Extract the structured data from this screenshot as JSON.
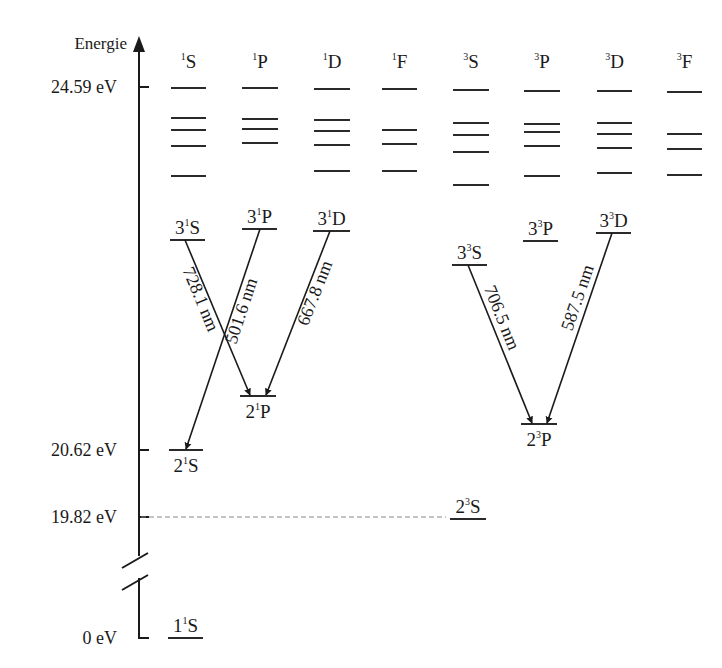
{
  "axis": {
    "label": "Energie",
    "x": 139,
    "top_y": 36,
    "break_top_y": 556,
    "break_bottom_y": 578,
    "bottom_y": 638,
    "ticks": [
      {
        "label": "24.59 eV",
        "y": 87
      },
      {
        "label": "20.62 eV",
        "y": 450
      },
      {
        "label": "19.82 eV",
        "y": 517
      },
      {
        "label": "0 eV",
        "y": 638
      }
    ]
  },
  "columns": [
    {
      "id": "1S",
      "mult": "1",
      "L": "S",
      "x1": 171,
      "x2": 206,
      "levels_y": [
        88,
        118,
        130,
        146,
        176
      ]
    },
    {
      "id": "1P",
      "mult": "1",
      "L": "P",
      "x1": 242,
      "x2": 278,
      "levels_y": [
        88,
        119,
        129,
        143
      ]
    },
    {
      "id": "1D",
      "mult": "1",
      "L": "D",
      "x1": 314,
      "x2": 350,
      "levels_y": [
        89,
        120,
        131,
        145,
        171
      ]
    },
    {
      "id": "1F",
      "mult": "1",
      "L": "F",
      "x1": 382,
      "x2": 417,
      "levels_y": [
        89,
        130,
        144,
        171
      ]
    },
    {
      "id": "3S",
      "mult": "3",
      "L": "S",
      "x1": 453,
      "x2": 489,
      "levels_y": [
        90,
        123,
        135,
        152,
        185
      ]
    },
    {
      "id": "3P",
      "mult": "3",
      "L": "P",
      "x1": 524,
      "x2": 560,
      "levels_y": [
        91,
        124,
        132,
        146,
        176
      ]
    },
    {
      "id": "3D",
      "mult": "3",
      "L": "D",
      "x1": 597,
      "x2": 632,
      "levels_y": [
        91,
        123,
        134,
        148,
        173
      ]
    },
    {
      "id": "3F",
      "mult": "3",
      "L": "F",
      "x1": 667,
      "x2": 702,
      "levels_y": [
        92,
        134,
        149,
        175
      ]
    }
  ],
  "states": [
    {
      "name": "3-1S",
      "n": "3",
      "mult": "1",
      "L": "S",
      "x1": 170,
      "x2": 205,
      "y": 240,
      "label_pos": "above"
    },
    {
      "name": "3-1P",
      "n": "3",
      "mult": "1",
      "L": "P",
      "x1": 242,
      "x2": 277,
      "y": 229,
      "label_pos": "above"
    },
    {
      "name": "3-1D",
      "n": "3",
      "mult": "1",
      "L": "D",
      "x1": 313,
      "x2": 350,
      "y": 231,
      "label_pos": "above"
    },
    {
      "name": "2-1P",
      "n": "2",
      "mult": "1",
      "L": "P",
      "x1": 240,
      "x2": 276,
      "y": 396,
      "label_pos": "below"
    },
    {
      "name": "2-1S",
      "n": "2",
      "mult": "1",
      "L": "S",
      "x1": 169,
      "x2": 203,
      "y": 450,
      "label_pos": "below"
    },
    {
      "name": "1-1S",
      "n": "1",
      "mult": "1",
      "L": "S",
      "x1": 168,
      "x2": 203,
      "y": 638,
      "label_pos": "above"
    },
    {
      "name": "3-3S",
      "n": "3",
      "mult": "3",
      "L": "S",
      "x1": 452,
      "x2": 487,
      "y": 265,
      "label_pos": "above"
    },
    {
      "name": "3-3P",
      "n": "3",
      "mult": "3",
      "L": "P",
      "x1": 523,
      "x2": 558,
      "y": 241,
      "label_pos": "above"
    },
    {
      "name": "3-3D",
      "n": "3",
      "mult": "3",
      "L": "D",
      "x1": 596,
      "x2": 631,
      "y": 233,
      "label_pos": "above"
    },
    {
      "name": "2-3P",
      "n": "2",
      "mult": "3",
      "L": "P",
      "x1": 521,
      "x2": 557,
      "y": 424,
      "label_pos": "below"
    },
    {
      "name": "2-3S",
      "n": "2",
      "mult": "3",
      "L": "S",
      "x1": 450,
      "x2": 486,
      "y": 519,
      "label_pos": "above"
    }
  ],
  "transitions": [
    {
      "from": "3-1S",
      "to": "2-1P",
      "label": "728.1 nm",
      "x1": 185,
      "y1": 240,
      "x2": 250,
      "y2": 395,
      "label_side": "left"
    },
    {
      "from": "3-1P",
      "to": "2-1S",
      "label": "501.6 nm",
      "x1": 260,
      "y1": 229,
      "x2": 186,
      "y2": 449,
      "label_side": "right"
    },
    {
      "from": "3-1D",
      "to": "2-1P",
      "label": "667.8 nm",
      "x1": 330,
      "y1": 231,
      "x2": 266,
      "y2": 395,
      "label_side": "right"
    },
    {
      "from": "3-3S",
      "to": "2-3P",
      "label": "706.5 nm",
      "x1": 468,
      "y1": 265,
      "x2": 532,
      "y2": 423,
      "label_side": "right"
    },
    {
      "from": "3-3D",
      "to": "2-3P",
      "label": "587.5 nm",
      "x1": 612,
      "y1": 233,
      "x2": 547,
      "y2": 423,
      "label_side": "left"
    }
  ],
  "dashed_line": {
    "x1": 141,
    "x2": 446,
    "y": 517
  }
}
